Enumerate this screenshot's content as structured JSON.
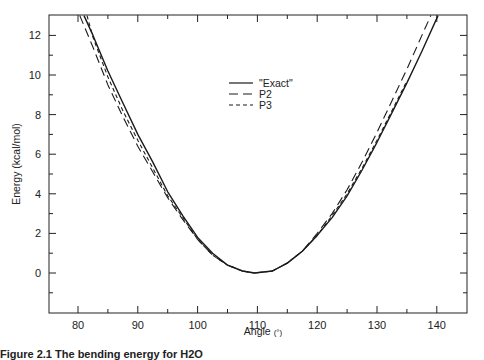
{
  "chart_data": {
    "type": "line",
    "title": "",
    "xlabel": "Angle",
    "xlabel_unit": "(°)",
    "ylabel": "Energy (kcal/mol)",
    "xlim": [
      75,
      145
    ],
    "ylim": [
      -2,
      13
    ],
    "x_ticks": [
      80,
      90,
      100,
      110,
      120,
      130,
      140
    ],
    "x_minor_ticks": [
      85,
      95,
      105,
      115,
      125,
      135
    ],
    "y_ticks": [
      0,
      2,
      4,
      6,
      8,
      10,
      12
    ],
    "y_minor_ticks": [
      -1,
      1,
      3,
      5,
      7,
      9,
      11
    ],
    "grid": false,
    "legend_position": "upper center",
    "series": [
      {
        "name": "\"Exact\"",
        "style": "solid",
        "x": [
          81.0,
          82.5,
          85,
          87.5,
          90,
          92.5,
          95,
          97.5,
          100,
          102.5,
          105,
          107.5,
          109.5,
          112.5,
          115,
          117.5,
          120,
          122.5,
          125,
          127.5,
          130,
          132.5,
          135,
          137.5,
          140.2
        ],
        "y": [
          13.0,
          12.0,
          10.2,
          8.6,
          7.0,
          5.6,
          4.1,
          2.9,
          1.8,
          1.0,
          0.4,
          0.1,
          0.0,
          0.1,
          0.5,
          1.1,
          1.9,
          2.8,
          3.9,
          5.2,
          6.6,
          8.1,
          9.6,
          11.2,
          13.0
        ]
      },
      {
        "name": "P2",
        "style": "long-dash",
        "x": [
          80.3,
          82.5,
          85,
          87.5,
          90,
          92.5,
          95,
          97.5,
          100,
          102.5,
          105,
          107.5,
          109.5,
          112.5,
          115,
          117.5,
          120,
          122.5,
          125,
          127.5,
          130,
          132.5,
          135,
          137.5,
          139.0
        ],
        "y": [
          13.0,
          11.4,
          9.5,
          7.9,
          6.4,
          5.1,
          3.8,
          2.7,
          1.7,
          0.9,
          0.4,
          0.1,
          0.0,
          0.1,
          0.5,
          1.1,
          2.0,
          3.0,
          4.2,
          5.6,
          7.1,
          8.7,
          10.3,
          12.0,
          13.0
        ]
      },
      {
        "name": "P3",
        "style": "short-dash",
        "x": [
          81.5,
          82.5,
          85,
          87.5,
          90,
          92.5,
          95,
          97.5,
          100,
          102.5,
          105,
          107.5,
          109.5,
          112.5,
          115,
          117.5,
          120,
          122.5,
          125,
          127.5,
          130,
          132.5,
          135
        ],
        "y": [
          13.0,
          11.9,
          9.9,
          8.2,
          6.7,
          5.3,
          3.9,
          2.8,
          1.7,
          0.9,
          0.4,
          0.1,
          0.0,
          0.1,
          0.5,
          1.1,
          1.9,
          2.9,
          4.0,
          5.3,
          6.7,
          8.2,
          9.7
        ]
      }
    ]
  },
  "legend": {
    "items": [
      {
        "label": "\"Exact\"",
        "style": "solid"
      },
      {
        "label": "P2",
        "style": "long-dash"
      },
      {
        "label": "P3",
        "style": "short-dash"
      }
    ]
  },
  "axes": {
    "x_title": "Angle",
    "x_unit": "(°)",
    "y_title": "Energy (kcal/mol)"
  },
  "caption": {
    "text": "Figure 2.1  The bending energy for H2O"
  }
}
